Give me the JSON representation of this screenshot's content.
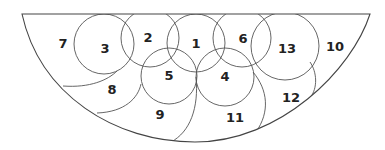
{
  "diagram": {
    "stroke_color": "#555555",
    "background": "#ffffff",
    "regions": [
      {
        "id": "1",
        "label": "1",
        "x": 196,
        "y": 43
      },
      {
        "id": "2",
        "label": "2",
        "x": 148,
        "y": 37
      },
      {
        "id": "3",
        "label": "3",
        "x": 105,
        "y": 48
      },
      {
        "id": "4",
        "label": "4",
        "x": 225,
        "y": 76
      },
      {
        "id": "5",
        "label": "5",
        "x": 169,
        "y": 75
      },
      {
        "id": "6",
        "label": "6",
        "x": 243,
        "y": 38
      },
      {
        "id": "7",
        "label": "7",
        "x": 63,
        "y": 43
      },
      {
        "id": "8",
        "label": "8",
        "x": 112,
        "y": 89
      },
      {
        "id": "9",
        "label": "9",
        "x": 160,
        "y": 114
      },
      {
        "id": "10",
        "label": "10",
        "x": 335,
        "y": 46
      },
      {
        "id": "11",
        "label": "11",
        "x": 235,
        "y": 117
      },
      {
        "id": "12",
        "label": "12",
        "x": 291,
        "y": 97
      },
      {
        "id": "13",
        "label": "13",
        "x": 287,
        "y": 48
      }
    ]
  }
}
